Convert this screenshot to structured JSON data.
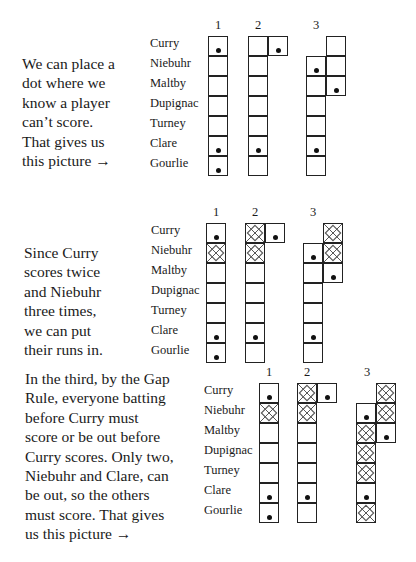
{
  "players": [
    "Curry",
    "Niebuhr",
    "Maltby",
    "Dupignac",
    "Turney",
    "Clare",
    "Gourlie"
  ],
  "innings_labels": [
    "1",
    "2",
    "3"
  ],
  "panels": [
    {
      "id": "panel-1",
      "text_lines": [
        "We can place a",
        "dot where we",
        "know a player",
        "can’t score.",
        "That gives us",
        "this picture →"
      ],
      "text_pos": {
        "x": 22,
        "y": 54
      },
      "names_pos": {
        "x": 150,
        "y": 33
      },
      "grid_origin": {
        "x": 208,
        "y": 36
      },
      "label_y": 18,
      "innings": [
        {
          "label_x": 208,
          "cells": [
            {
              "dx": 0,
              "row": 0,
              "mark": "dot"
            },
            {
              "dx": 0,
              "row": 1,
              "mark": ""
            },
            {
              "dx": 0,
              "row": 2,
              "mark": ""
            },
            {
              "dx": 0,
              "row": 3,
              "mark": ""
            },
            {
              "dx": 0,
              "row": 4,
              "mark": ""
            },
            {
              "dx": 0,
              "row": 5,
              "mark": "dot"
            },
            {
              "dx": 0,
              "row": 6,
              "mark": "dot"
            }
          ]
        },
        {
          "label_x": 248,
          "cells": [
            {
              "dx": 40,
              "row": 0,
              "mark": ""
            },
            {
              "dx": 60,
              "row": 0,
              "mark": "dot"
            },
            {
              "dx": 40,
              "row": 1,
              "mark": ""
            },
            {
              "dx": 40,
              "row": 2,
              "mark": ""
            },
            {
              "dx": 40,
              "row": 3,
              "mark": ""
            },
            {
              "dx": 40,
              "row": 4,
              "mark": ""
            },
            {
              "dx": 40,
              "row": 5,
              "mark": "dot"
            },
            {
              "dx": 40,
              "row": 6,
              "mark": ""
            }
          ]
        },
        {
          "label_x": 306,
          "cells": [
            {
              "dx": 118,
              "row": 0,
              "mark": ""
            },
            {
              "dx": 118,
              "row": 1,
              "mark": ""
            },
            {
              "dx": 118,
              "row": 2,
              "mark": "dot"
            },
            {
              "dx": 98,
              "row": 1,
              "mark": "dot"
            },
            {
              "dx": 98,
              "row": 2,
              "mark": ""
            },
            {
              "dx": 98,
              "row": 3,
              "mark": ""
            },
            {
              "dx": 98,
              "row": 4,
              "mark": ""
            },
            {
              "dx": 98,
              "row": 5,
              "mark": "dot"
            },
            {
              "dx": 98,
              "row": 6,
              "mark": ""
            }
          ]
        }
      ]
    },
    {
      "id": "panel-2",
      "text_lines": [
        "Since Curry",
        "scores twice",
        "and Niebuhr",
        "three times,",
        "we can put",
        "their runs in."
      ],
      "text_pos": {
        "x": 24,
        "y": 243
      },
      "names_pos": {
        "x": 151,
        "y": 220
      },
      "grid_origin": {
        "x": 206,
        "y": 223
      },
      "label_y": 205,
      "innings": [
        {
          "label_x": 206,
          "cells": [
            {
              "dx": 0,
              "row": 0,
              "mark": "dot"
            },
            {
              "dx": 0,
              "row": 1,
              "mark": "x"
            },
            {
              "dx": 0,
              "row": 2,
              "mark": ""
            },
            {
              "dx": 0,
              "row": 3,
              "mark": ""
            },
            {
              "dx": 0,
              "row": 4,
              "mark": ""
            },
            {
              "dx": 0,
              "row": 5,
              "mark": "dot"
            },
            {
              "dx": 0,
              "row": 6,
              "mark": "dot"
            }
          ]
        },
        {
          "label_x": 245,
          "cells": [
            {
              "dx": 39,
              "row": 0,
              "mark": "x"
            },
            {
              "dx": 59,
              "row": 0,
              "mark": "dot"
            },
            {
              "dx": 39,
              "row": 1,
              "mark": "x"
            },
            {
              "dx": 39,
              "row": 2,
              "mark": ""
            },
            {
              "dx": 39,
              "row": 3,
              "mark": ""
            },
            {
              "dx": 39,
              "row": 4,
              "mark": ""
            },
            {
              "dx": 39,
              "row": 5,
              "mark": "dot"
            },
            {
              "dx": 39,
              "row": 6,
              "mark": ""
            }
          ]
        },
        {
          "label_x": 303,
          "cells": [
            {
              "dx": 117,
              "row": 0,
              "mark": "x"
            },
            {
              "dx": 117,
              "row": 1,
              "mark": "x"
            },
            {
              "dx": 117,
              "row": 2,
              "mark": "dot"
            },
            {
              "dx": 97,
              "row": 1,
              "mark": "dot"
            },
            {
              "dx": 97,
              "row": 2,
              "mark": ""
            },
            {
              "dx": 97,
              "row": 3,
              "mark": ""
            },
            {
              "dx": 97,
              "row": 4,
              "mark": ""
            },
            {
              "dx": 97,
              "row": 5,
              "mark": "dot"
            },
            {
              "dx": 97,
              "row": 6,
              "mark": ""
            }
          ]
        }
      ]
    },
    {
      "id": "panel-3",
      "text_lines": [
        "In the third, by the Gap",
        "Rule, everyone batting",
        "before Curry must",
        "score or be out before",
        "Curry scores. Only two,",
        "Niebuhr and Clare, can",
        "be out, so the others",
        "must score. That gives",
        "us this picture →"
      ],
      "text_pos": {
        "x": 25,
        "y": 369
      },
      "names_pos": {
        "x": 204,
        "y": 380
      },
      "grid_origin": {
        "x": 259,
        "y": 383
      },
      "label_y": 365,
      "innings": [
        {
          "label_x": 259,
          "cells": [
            {
              "dx": 0,
              "row": 0,
              "mark": "dot"
            },
            {
              "dx": 0,
              "row": 1,
              "mark": "x"
            },
            {
              "dx": 0,
              "row": 2,
              "mark": ""
            },
            {
              "dx": 0,
              "row": 3,
              "mark": ""
            },
            {
              "dx": 0,
              "row": 4,
              "mark": ""
            },
            {
              "dx": 0,
              "row": 5,
              "mark": "dot"
            },
            {
              "dx": 0,
              "row": 6,
              "mark": "dot"
            }
          ]
        },
        {
          "label_x": 297,
          "cells": [
            {
              "dx": 38,
              "row": 0,
              "mark": "x"
            },
            {
              "dx": 58,
              "row": 0,
              "mark": "dot"
            },
            {
              "dx": 38,
              "row": 1,
              "mark": "x"
            },
            {
              "dx": 38,
              "row": 2,
              "mark": ""
            },
            {
              "dx": 38,
              "row": 3,
              "mark": ""
            },
            {
              "dx": 38,
              "row": 4,
              "mark": ""
            },
            {
              "dx": 38,
              "row": 5,
              "mark": "dot"
            },
            {
              "dx": 38,
              "row": 6,
              "mark": ""
            }
          ]
        },
        {
          "label_x": 357,
          "cells": [
            {
              "dx": 117,
              "row": 0,
              "mark": "x"
            },
            {
              "dx": 117,
              "row": 1,
              "mark": "x"
            },
            {
              "dx": 117,
              "row": 2,
              "mark": "dot"
            },
            {
              "dx": 97,
              "row": 1,
              "mark": "dot"
            },
            {
              "dx": 97,
              "row": 2,
              "mark": "x"
            },
            {
              "dx": 97,
              "row": 3,
              "mark": "x"
            },
            {
              "dx": 97,
              "row": 4,
              "mark": "x"
            },
            {
              "dx": 97,
              "row": 5,
              "mark": "dot"
            },
            {
              "dx": 97,
              "row": 6,
              "mark": "x"
            }
          ]
        }
      ]
    }
  ]
}
